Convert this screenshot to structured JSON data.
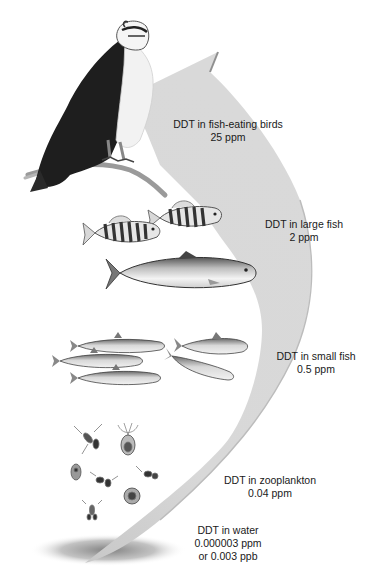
{
  "diagram": {
    "type": "biomagnification-food-chain",
    "colors": {
      "arrow_fill": "#d6d6d6",
      "arrow_edge": "#bdbdbd",
      "text": "#1a1a1a",
      "background": "#ffffff",
      "shadow": "#8a8a8a"
    },
    "levels": [
      {
        "organism": "fish-eating birds",
        "icon": "osprey-icon",
        "title": "DDT in fish-eating birds",
        "value": "25 ppm"
      },
      {
        "organism": "large fish",
        "icon": "large-fish-icon",
        "title": "DDT in large fish",
        "value": "2 ppm"
      },
      {
        "organism": "small fish",
        "icon": "small-fish-icon",
        "title": "DDT in small fish",
        "value": "0.5 ppm"
      },
      {
        "organism": "zooplankton",
        "icon": "zooplankton-icon",
        "title": "DDT in zooplankton",
        "value": "0.04 ppm"
      },
      {
        "organism": "water",
        "icon": "water-shadow",
        "title": "DDT in water",
        "value": "0.000003 ppm",
        "value_alt": "or 0.003 ppb"
      }
    ]
  }
}
